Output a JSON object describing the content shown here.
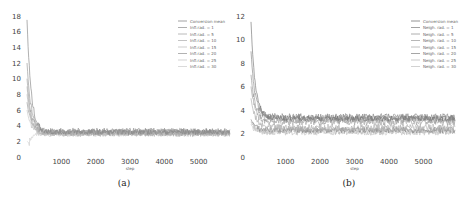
{
  "chart_data": [
    {
      "type": "line",
      "caption": "(a)",
      "title": "",
      "xlabel": "step",
      "ylabel": "",
      "xlim": [
        0,
        6000
      ],
      "ylim": [
        0,
        18
      ],
      "xticks": [
        1000,
        2000,
        3000,
        4000,
        5000
      ],
      "yticks": [
        0,
        2,
        4,
        6,
        8,
        10,
        12,
        14,
        16,
        18
      ],
      "grid": false,
      "legend_position": "top-right",
      "series": [
        {
          "name": "Conversion mean",
          "color": "#8a8a8a",
          "start": 17.5,
          "plateau": 3.2,
          "noise": 0.35,
          "min_dip": null
        },
        {
          "name": "Infl.rad. = 1",
          "color": "#9a9a9a",
          "start": 12.0,
          "plateau": 3.3,
          "noise": 0.4,
          "min_dip": null
        },
        {
          "name": "Infl.rad. = 5",
          "color": "#a8a8a8",
          "start": 10.0,
          "plateau": 3.1,
          "noise": 0.4,
          "min_dip": null
        },
        {
          "name": "Infl.rad. = 10",
          "color": "#b5b5b5",
          "start": 9.0,
          "plateau": 3.0,
          "noise": 0.4,
          "min_dip": null
        },
        {
          "name": "Infl.rad. = 15",
          "color": "#c0c0c0",
          "start": 8.0,
          "plateau": 3.0,
          "noise": 0.35,
          "min_dip": null
        },
        {
          "name": "Infl.rad. = 20",
          "color": "#9e9e9e",
          "start": 7.0,
          "plateau": 3.2,
          "noise": 0.35,
          "min_dip": null
        },
        {
          "name": "Infl.rad. = 25",
          "color": "#c8c8c8",
          "start": 6.0,
          "plateau": 2.9,
          "noise": 0.3,
          "min_dip": null
        },
        {
          "name": "Infl.rad. = 30",
          "color": "#d0d0d0",
          "start": 2.0,
          "plateau": 3.0,
          "noise": 0.3,
          "min_dip": 1.7
        }
      ]
    },
    {
      "type": "line",
      "caption": "(b)",
      "title": "",
      "xlabel": "step",
      "ylabel": "",
      "xlim": [
        0,
        6000
      ],
      "ylim": [
        0,
        12
      ],
      "xticks": [
        1000,
        2000,
        3000,
        4000,
        5000
      ],
      "yticks": [
        0,
        2,
        4,
        6,
        8,
        10,
        12
      ],
      "grid": false,
      "legend_position": "top-right",
      "series": [
        {
          "name": "Conversion mean",
          "color": "#7a7a7a",
          "start": 11.5,
          "plateau": 3.3,
          "noise": 0.25,
          "min_dip": null
        },
        {
          "name": "Neigh. rad. = 1",
          "color": "#8c8c8c",
          "start": 9.0,
          "plateau": 3.4,
          "noise": 0.3,
          "min_dip": null
        },
        {
          "name": "Neigh. rad. = 5",
          "color": "#9a9a9a",
          "start": 7.0,
          "plateau": 3.2,
          "noise": 0.3,
          "min_dip": null
        },
        {
          "name": "Neigh. rad. = 10",
          "color": "#a5a5a5",
          "start": 6.0,
          "plateau": 3.0,
          "noise": 0.3,
          "min_dip": null
        },
        {
          "name": "Neigh. rad. = 15",
          "color": "#b0b0b0",
          "start": 5.0,
          "plateau": 2.5,
          "noise": 0.3,
          "min_dip": null
        },
        {
          "name": "Neigh. rad. = 20",
          "color": "#8f8f8f",
          "start": 3.2,
          "plateau": 2.3,
          "noise": 0.25,
          "min_dip": null
        },
        {
          "name": "Neigh. rad. = 25",
          "color": "#bdbdbd",
          "start": 3.0,
          "plateau": 2.2,
          "noise": 0.25,
          "min_dip": null
        },
        {
          "name": "Neigh. rad. = 30",
          "color": "#c6c6c6",
          "start": 2.8,
          "plateau": 2.1,
          "noise": 0.25,
          "min_dip": null
        }
      ]
    }
  ]
}
